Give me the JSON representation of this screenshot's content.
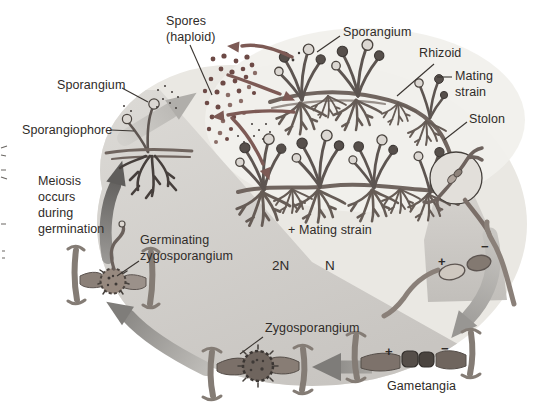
{
  "labels": {
    "spores": "Spores\n(haploid)",
    "sporangium_top": "Sporangium",
    "rhizoid": "Rhizoid",
    "mating_strain": "Mating\nstrain",
    "stolon": "Stolon",
    "sporangium_left": "Sporangium",
    "sporangiophore": "Sporangiophore",
    "meiosis_note": "Meiosis\noccurs\nduring\ngermination",
    "germinating_zygosporangium": "Germinating\nzygosporangium",
    "plus_mating_strain": "+ Mating strain",
    "ploidy_diploid": "2N",
    "ploidy_haploid": "N",
    "zygosporangium": "Zygosporangium",
    "gametangia": "Gametangia",
    "plus_sign": "+",
    "minus_sign": "−"
  },
  "colors": {
    "spore_dot": "#6d4a46",
    "maroon_arrow": "#7d5a55",
    "hypha": "#5d5551",
    "background_blob": "#eae8e3",
    "diploid_wedge": "#cdcac6",
    "cycle_arrow_light": "#c3c1bd",
    "cycle_arrow_dark": "#6f6d6b",
    "text": "#2f2b28"
  }
}
